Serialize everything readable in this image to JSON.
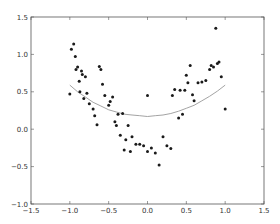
{
  "chart_data": {
    "type": "scatter",
    "title": "",
    "xlabel": "",
    "ylabel": "",
    "xlim": [
      -1.5,
      1.5
    ],
    "ylim": [
      -1.0,
      1.5
    ],
    "grid": false,
    "legend": null,
    "xticks": [
      -1.5,
      -1.0,
      -0.5,
      0.0,
      0.5,
      1.0,
      1.5
    ],
    "xtick_labels": [
      "−1.5",
      "−1.0",
      "−0.5",
      "0.0",
      "0.5",
      "1.0",
      "1.5"
    ],
    "yticks": [
      -1.0,
      -0.5,
      0.0,
      0.5,
      1.0,
      1.5
    ],
    "ytick_labels": [
      "−1.0",
      "−0.5",
      "0.0",
      "0.5",
      "1.0",
      "1.5"
    ],
    "series": [
      {
        "name": "points",
        "kind": "scatter",
        "color": "#1a1a1a",
        "x": [
          -1.0,
          -0.98,
          -0.95,
          -0.93,
          -0.92,
          -0.9,
          -0.88,
          -0.87,
          -0.85,
          -0.84,
          -0.82,
          -0.8,
          -0.78,
          -0.75,
          -0.7,
          -0.68,
          -0.65,
          -0.62,
          -0.6,
          -0.58,
          -0.55,
          -0.5,
          -0.48,
          -0.45,
          -0.42,
          -0.4,
          -0.38,
          -0.35,
          -0.32,
          -0.3,
          -0.28,
          -0.25,
          -0.22,
          -0.2,
          -0.15,
          -0.1,
          -0.05,
          0.0,
          0.0,
          0.05,
          0.1,
          0.15,
          0.2,
          0.25,
          0.3,
          0.32,
          0.35,
          0.4,
          0.42,
          0.45,
          0.48,
          0.5,
          0.52,
          0.55,
          0.58,
          0.6,
          0.65,
          0.7,
          0.75,
          0.8,
          0.82,
          0.85,
          0.88,
          0.9,
          0.92,
          0.95,
          1.0
        ],
        "y": [
          0.47,
          1.07,
          1.14,
          0.97,
          0.8,
          0.83,
          0.64,
          0.5,
          0.78,
          0.73,
          0.41,
          0.7,
          0.48,
          0.34,
          0.27,
          0.18,
          0.06,
          0.84,
          0.8,
          0.6,
          0.45,
          0.32,
          0.37,
          0.43,
          0.1,
          0.05,
          0.2,
          -0.08,
          0.21,
          -0.28,
          -0.14,
          0.05,
          -0.3,
          -0.1,
          -0.2,
          -0.2,
          -0.22,
          -0.3,
          0.45,
          -0.25,
          -0.32,
          -0.48,
          -0.1,
          -0.22,
          -0.26,
          0.45,
          0.53,
          0.15,
          0.52,
          0.2,
          0.52,
          0.72,
          0.62,
          0.85,
          0.46,
          0.38,
          0.62,
          0.63,
          0.65,
          0.8,
          0.85,
          0.83,
          1.35,
          0.88,
          0.9,
          0.7,
          0.27
        ]
      },
      {
        "name": "fit",
        "kind": "line",
        "color": "#999999",
        "x": [
          -1.0,
          -0.9,
          -0.8,
          -0.7,
          -0.6,
          -0.5,
          -0.4,
          -0.3,
          -0.2,
          -0.1,
          0.0,
          0.1,
          0.2,
          0.3,
          0.4,
          0.5,
          0.6,
          0.7,
          0.8,
          0.9,
          1.0
        ],
        "y": [
          0.59,
          0.5,
          0.43,
          0.36,
          0.31,
          0.26,
          0.23,
          0.2,
          0.19,
          0.18,
          0.17,
          0.18,
          0.19,
          0.21,
          0.24,
          0.28,
          0.32,
          0.38,
          0.44,
          0.51,
          0.59
        ]
      }
    ]
  }
}
